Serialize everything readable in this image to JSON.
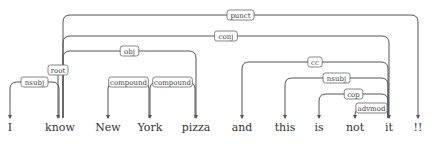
{
  "diagram": {
    "type": "dependency-parse",
    "sentence": "I know New York pizza and this is not it !!",
    "tokens": [
      {
        "id": 0,
        "text": "I",
        "x": 10
      },
      {
        "id": 1,
        "text": "know",
        "x": 60
      },
      {
        "id": 2,
        "text": "New",
        "x": 108
      },
      {
        "id": 3,
        "text": "York",
        "x": 150
      },
      {
        "id": 4,
        "text": "pizza",
        "x": 196
      },
      {
        "id": 5,
        "text": "and",
        "x": 242
      },
      {
        "id": 6,
        "text": "this",
        "x": 285
      },
      {
        "id": 7,
        "text": "is",
        "x": 319
      },
      {
        "id": 8,
        "text": "not",
        "x": 355
      },
      {
        "id": 9,
        "text": "it",
        "x": 389
      },
      {
        "id": 10,
        "text": "!!",
        "x": 418
      }
    ],
    "edges": [
      {
        "label": "nsubj",
        "head": 1,
        "dep": 0,
        "level": 1
      },
      {
        "label": "compound",
        "head": 3,
        "dep": 2,
        "level": 1
      },
      {
        "label": "compound",
        "head": 4,
        "dep": 3,
        "level": 1
      },
      {
        "label": "obj",
        "head": 1,
        "dep": 4,
        "level": 2
      },
      {
        "label": "advmod",
        "head": 9,
        "dep": 8,
        "level": 1
      },
      {
        "label": "cop",
        "head": 9,
        "dep": 7,
        "level": 2
      },
      {
        "label": "nsubj",
        "head": 9,
        "dep": 6,
        "level": 3
      },
      {
        "label": "cc",
        "head": 9,
        "dep": 5,
        "level": 4
      },
      {
        "label": "conj",
        "head": 1,
        "dep": 9,
        "level": 5
      },
      {
        "label": "punct",
        "head": 1,
        "dep": 10,
        "level": 6
      }
    ],
    "root": {
      "label": "root",
      "dep": 1
    }
  }
}
